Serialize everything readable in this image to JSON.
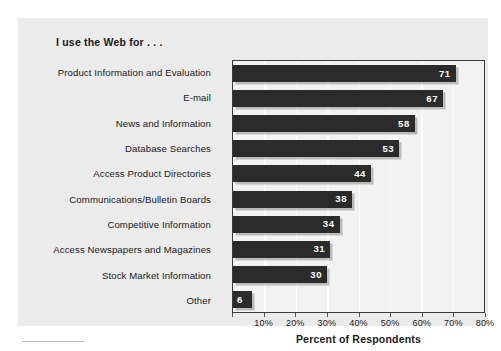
{
  "chart_data": {
    "type": "bar",
    "orientation": "horizontal",
    "title": "I use the Web for . . .",
    "xlabel": "Percent of Respondents",
    "ylabel": "",
    "xlim": [
      0,
      80
    ],
    "grid": true,
    "legend": "none",
    "categories": [
      "Product Information and Evaluation",
      "E-mail",
      "News and Information",
      "Database Searches",
      "Access Product Directories",
      "Communications/Bulletin Boards",
      "Competitive Information",
      "Access Newspapers and Magazines",
      "Stock Market Information",
      "Other"
    ],
    "values": [
      71,
      67,
      58,
      53,
      44,
      38,
      34,
      31,
      30,
      6
    ],
    "value_labels": [
      "71",
      "67",
      "58",
      "53",
      "44",
      "38",
      "34",
      "31",
      "30",
      "6"
    ],
    "xticks": [
      0,
      10,
      20,
      30,
      40,
      50,
      60,
      70,
      80
    ],
    "xticklabels": [
      "",
      "10%",
      "20%",
      "30%",
      "40%",
      "50%",
      "60%",
      "70%",
      "80%"
    ],
    "bar_color": "#2b2b2b",
    "plot_background": "#f2f2f2",
    "gridline_color": "#fbfbfb",
    "card_background": "#ebebeb",
    "value_label_color": "#ffffff"
  }
}
